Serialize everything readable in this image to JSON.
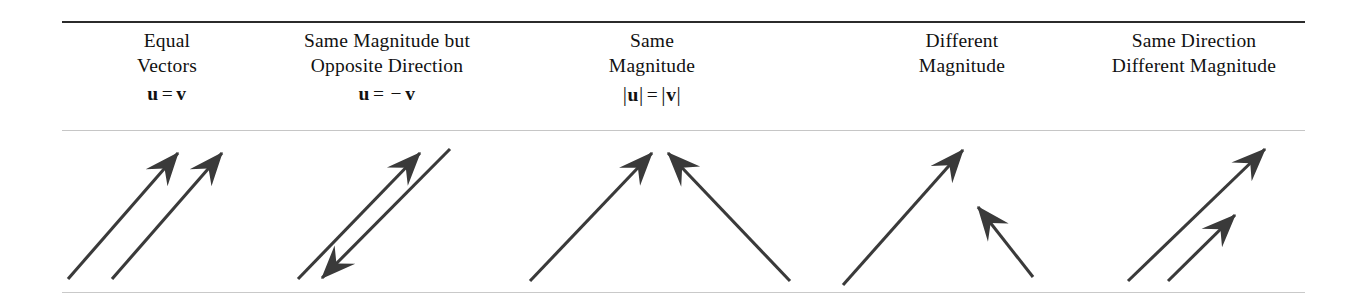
{
  "figure": {
    "rules": {
      "top_color": "#2b2b2b",
      "mid_color": "#c6c6c6",
      "bottom_color": "#c9c9c9"
    },
    "stroke_color": "#3a3a3a",
    "background": "#ffffff"
  },
  "columns": [
    {
      "id": "equal-vectors",
      "line1": "Equal",
      "line2": "Vectors",
      "formula": {
        "left": "u",
        "equals": "=",
        "right": "v",
        "text": "u = v",
        "has_bars": false,
        "negated": false
      },
      "diagram": {
        "description": "Two identical parallel arrows pointing up and to the right",
        "vectors": [
          {
            "name": "u",
            "x1": 68,
            "y1": 148,
            "x2": 178,
            "y2": 22,
            "head_at": "tip"
          },
          {
            "name": "v",
            "x1": 112,
            "y1": 148,
            "x2": 222,
            "y2": 22,
            "head_at": "tip"
          }
        ]
      }
    },
    {
      "id": "same-magnitude-opposite-direction",
      "line1": "Same Magnitude but",
      "line2": "Opposite Direction",
      "formula": {
        "left": "u",
        "equals": "=",
        "right": "v",
        "text": "u = −v",
        "has_bars": false,
        "negated": true,
        "minus": "−"
      },
      "diagram": {
        "description": "Left arrow points up-right, right arrow points down-left",
        "vectors": [
          {
            "name": "u",
            "x1": 298,
            "y1": 148,
            "x2": 420,
            "y2": 22,
            "head_at": "tip"
          },
          {
            "name": "-v",
            "x1": 450,
            "y1": 18,
            "x2": 322,
            "y2": 147,
            "head_at": "tip"
          }
        ]
      }
    },
    {
      "id": "same-magnitude",
      "line1": "Same",
      "line2": "Magnitude",
      "formula": {
        "left": "u",
        "equals": "=",
        "right": "v",
        "text": "|u| = |v|",
        "has_bars": true,
        "negated": false
      },
      "diagram": {
        "description": "Two equal-length arrows meeting head-to-head at top center forming an inverted V",
        "vectors": [
          {
            "name": "u",
            "x1": 530,
            "y1": 150,
            "x2": 652,
            "y2": 22,
            "head_at": "tip"
          },
          {
            "name": "v",
            "x1": 790,
            "y1": 150,
            "x2": 668,
            "y2": 22,
            "head_at": "tip"
          }
        ]
      }
    },
    {
      "id": "different-magnitude",
      "line1": "Different",
      "line2": "Magnitude",
      "formula": null,
      "diagram": {
        "description": "A long arrow pointing up-right and a shorter arrow pointing up-left",
        "vectors": [
          {
            "name": "u",
            "x1": 843,
            "y1": 154,
            "x2": 963,
            "y2": 19,
            "head_at": "tip"
          },
          {
            "name": "v",
            "x1": 1033,
            "y1": 146,
            "x2": 978,
            "y2": 76,
            "head_at": "tip"
          }
        ]
      }
    },
    {
      "id": "same-direction-different-magnitude",
      "line1": "Same Direction",
      "line2": "Different Magnitude",
      "formula": null,
      "diagram": {
        "description": "Two parallel arrows pointing up-right, the left one longer than the right one",
        "vectors": [
          {
            "name": "u",
            "x1": 1128,
            "y1": 150,
            "x2": 1265,
            "y2": 18,
            "head_at": "tip"
          },
          {
            "name": "v",
            "x1": 1168,
            "y1": 150,
            "x2": 1235,
            "y2": 84,
            "head_at": "tip"
          }
        ]
      }
    }
  ]
}
